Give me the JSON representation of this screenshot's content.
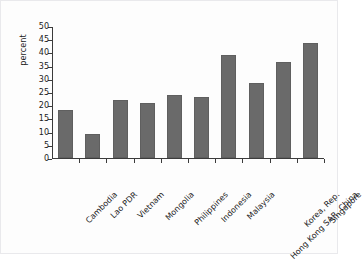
{
  "chart_data": {
    "type": "bar",
    "title": "",
    "xlabel": "",
    "ylabel": "percent",
    "ylim": [
      0,
      50
    ],
    "yticks": [
      0,
      5,
      10,
      15,
      20,
      25,
      30,
      35,
      40,
      45,
      50
    ],
    "grid": false,
    "legend": null,
    "bar_color": "#6a6a6a",
    "categories": [
      "Cambodia",
      "Lao PDR",
      "Vietnam",
      "Mongolia",
      "Philippines",
      "Indonesia",
      "Malaysia",
      "Hong Kong SAR, China",
      "Korea, Rep.",
      "Singapore"
    ],
    "values": [
      18,
      9,
      22,
      21,
      24,
      23,
      39,
      28.5,
      36.5,
      43.5
    ]
  }
}
